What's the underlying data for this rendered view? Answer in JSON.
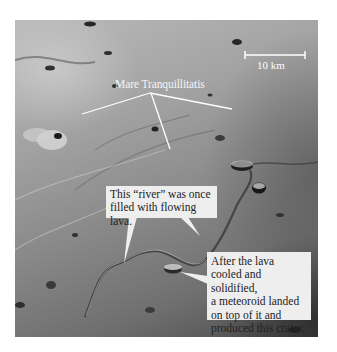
{
  "image": {
    "subject": "Lunar surface photograph",
    "description": "Aerial photograph of the Moon showing a lava channel (rille) with a crater on it"
  },
  "scale_bar": {
    "label": "10 km"
  },
  "labels": {
    "region_name": "Mare Tranquillitatis"
  },
  "callouts": {
    "river": {
      "lines": [
        "This “river” was once",
        "filled with flowing lava."
      ]
    },
    "crater": {
      "lines": [
        "After the lava",
        "cooled and solidified,",
        "a meteoroid landed",
        "on top of it and",
        "produced this crater."
      ]
    }
  },
  "colors": {
    "callout_background": "#eeeeee",
    "annotation_line": "#ffffff",
    "text_dark": "#222222"
  }
}
